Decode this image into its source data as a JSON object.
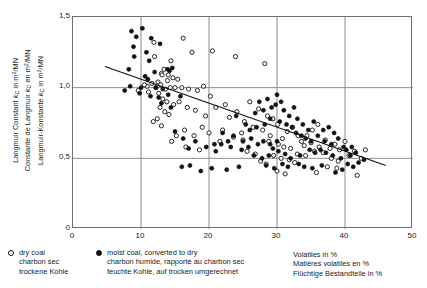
{
  "chart_data": {
    "type": "scatter",
    "title": "",
    "xlabel": "Volatiles in %",
    "ylabel": "Langmuir Constant kC in m2/MN",
    "xlim": [
      0,
      50
    ],
    "ylim": [
      0,
      1.5
    ],
    "grid": true,
    "y_ticks": [
      "1,5",
      "1,0",
      "0,5",
      "0"
    ],
    "y_tick_values": [
      1.5,
      1.0,
      0.5,
      0
    ],
    "x_ticks": [
      "0",
      "10",
      "20",
      "30",
      "40",
      "50"
    ],
    "x_tick_values": [
      0,
      10,
      20,
      30,
      40,
      50
    ],
    "legend_position": "below-left",
    "series": [
      {
        "name": "dry coal",
        "marker": "open-circle",
        "points": [
          [
            11.9,
            1.32
          ],
          [
            12.0,
            1.22
          ],
          [
            14.4,
            1.19
          ],
          [
            16.2,
            1.35
          ],
          [
            17.5,
            1.25
          ],
          [
            20.5,
            1.26
          ],
          [
            23.9,
            1.22
          ],
          [
            28.2,
            1.17
          ],
          [
            13.0,
            1.1
          ],
          [
            13.1,
            1.09
          ],
          [
            13.4,
            1.13
          ],
          [
            14.0,
            1.09
          ],
          [
            13.9,
            1.05
          ],
          [
            14.7,
            1.07
          ],
          [
            15.4,
            1.06
          ],
          [
            12.5,
            1.04
          ],
          [
            11.6,
            1.03
          ],
          [
            10.9,
            1.01
          ],
          [
            10.5,
            1.02
          ],
          [
            12.2,
            1.0
          ],
          [
            12.9,
            1.02
          ],
          [
            13.6,
            0.99
          ],
          [
            14.3,
            1.0
          ],
          [
            15.0,
            1.0
          ],
          [
            9.6,
            0.98
          ],
          [
            11.1,
            0.97
          ],
          [
            12.6,
            0.96
          ],
          [
            16.0,
            1.0
          ],
          [
            17.0,
            0.99
          ],
          [
            18.3,
            0.98
          ],
          [
            19.2,
            1.01
          ],
          [
            20.2,
            0.94
          ],
          [
            13.2,
            0.92
          ],
          [
            13.8,
            0.9
          ],
          [
            14.8,
            0.88
          ],
          [
            15.6,
            0.9
          ],
          [
            12.8,
            0.86
          ],
          [
            13.5,
            0.83
          ],
          [
            14.1,
            0.81
          ],
          [
            12.4,
            0.78
          ],
          [
            11.8,
            0.76
          ],
          [
            13.0,
            0.73
          ],
          [
            16.8,
            0.86
          ],
          [
            18.0,
            0.84
          ],
          [
            19.5,
            0.8
          ],
          [
            21.0,
            0.86
          ],
          [
            22.4,
            0.88
          ],
          [
            23.0,
            0.79
          ],
          [
            24.1,
            0.83
          ],
          [
            25.2,
            0.76
          ],
          [
            22.0,
            0.7
          ],
          [
            24.8,
            0.68
          ],
          [
            26.0,
            0.9
          ],
          [
            27.3,
            0.85
          ],
          [
            28.6,
            0.8
          ],
          [
            29.4,
            0.78
          ],
          [
            30.1,
            0.74
          ],
          [
            26.5,
            0.72
          ],
          [
            27.9,
            0.7
          ],
          [
            29.0,
            0.66
          ],
          [
            30.8,
            0.64
          ],
          [
            31.5,
            0.69
          ],
          [
            32.3,
            0.72
          ],
          [
            33.1,
            0.66
          ],
          [
            28.8,
            0.62
          ],
          [
            30.2,
            0.6
          ],
          [
            31.0,
            0.58
          ],
          [
            32.0,
            0.57
          ],
          [
            33.6,
            0.62
          ],
          [
            34.4,
            0.66
          ],
          [
            35.2,
            0.7
          ],
          [
            36.0,
            0.74
          ],
          [
            34.0,
            0.59
          ],
          [
            35.0,
            0.61
          ],
          [
            36.2,
            0.58
          ],
          [
            37.1,
            0.63
          ],
          [
            33.0,
            0.53
          ],
          [
            34.2,
            0.52
          ],
          [
            35.5,
            0.55
          ],
          [
            36.8,
            0.54
          ],
          [
            29.5,
            0.52
          ],
          [
            30.6,
            0.5
          ],
          [
            31.8,
            0.49
          ],
          [
            32.6,
            0.47
          ],
          [
            27.6,
            0.48
          ],
          [
            28.4,
            0.46
          ],
          [
            26.8,
            0.53
          ],
          [
            25.6,
            0.55
          ],
          [
            37.8,
            0.57
          ],
          [
            38.5,
            0.6
          ],
          [
            39.2,
            0.56
          ],
          [
            40.0,
            0.62
          ],
          [
            38.0,
            0.5
          ],
          [
            39.0,
            0.48
          ],
          [
            40.6,
            0.52
          ],
          [
            41.4,
            0.55
          ],
          [
            37.4,
            0.44
          ],
          [
            38.8,
            0.43
          ],
          [
            30.0,
            0.41
          ],
          [
            31.2,
            0.39
          ],
          [
            35.8,
            0.4
          ],
          [
            41.8,
            0.38
          ],
          [
            42.4,
            0.5
          ],
          [
            43.0,
            0.56
          ],
          [
            25.0,
            0.63
          ],
          [
            23.6,
            0.65
          ],
          [
            21.6,
            0.62
          ],
          [
            20.0,
            0.68
          ],
          [
            19.0,
            0.72
          ],
          [
            17.8,
            0.66
          ],
          [
            16.4,
            0.7
          ],
          [
            15.2,
            0.66
          ],
          [
            14.5,
            0.62
          ],
          [
            16.6,
            0.58
          ],
          [
            18.6,
            0.56
          ]
        ]
      },
      {
        "name": "moist coal, converted to dry",
        "marker": "filled-circle",
        "points": [
          [
            8.6,
            1.4
          ],
          [
            10.2,
            1.42
          ],
          [
            9.3,
            1.36
          ],
          [
            11.5,
            1.35
          ],
          [
            8.9,
            1.29
          ],
          [
            12.8,
            1.31
          ],
          [
            10.8,
            1.25
          ],
          [
            9.0,
            1.22
          ],
          [
            11.2,
            1.19
          ],
          [
            8.2,
            1.13
          ],
          [
            12.0,
            1.11
          ],
          [
            13.9,
            1.13
          ],
          [
            14.2,
            1.12
          ],
          [
            14.6,
            1.14
          ],
          [
            10.6,
            1.08
          ],
          [
            11.0,
            1.06
          ],
          [
            8.4,
            1.01
          ],
          [
            10.0,
            1.0
          ],
          [
            12.2,
            1.0
          ],
          [
            13.2,
            0.99
          ],
          [
            7.6,
            0.98
          ],
          [
            9.8,
            0.96
          ],
          [
            11.4,
            0.94
          ],
          [
            12.6,
            0.93
          ],
          [
            14.0,
            0.95
          ],
          [
            15.8,
            0.94
          ],
          [
            13.0,
            0.89
          ],
          [
            14.4,
            0.86
          ],
          [
            15.0,
            0.69
          ],
          [
            16.2,
            0.64
          ],
          [
            22.0,
            0.68
          ],
          [
            23.6,
            0.66
          ],
          [
            25.0,
            0.62
          ],
          [
            26.2,
            0.64
          ],
          [
            17.0,
            0.57
          ],
          [
            21.0,
            0.55
          ],
          [
            24.0,
            0.8
          ],
          [
            26.8,
            0.82
          ],
          [
            28.0,
            0.84
          ],
          [
            29.2,
            0.86
          ],
          [
            27.4,
            0.9
          ],
          [
            28.6,
            0.92
          ],
          [
            29.8,
            0.88
          ],
          [
            30.6,
            0.9
          ],
          [
            30.0,
            0.95
          ],
          [
            31.0,
            0.84
          ],
          [
            31.8,
            0.8
          ],
          [
            32.5,
            0.86
          ],
          [
            29.0,
            0.78
          ],
          [
            30.4,
            0.76
          ],
          [
            31.4,
            0.74
          ],
          [
            32.2,
            0.72
          ],
          [
            28.2,
            0.74
          ],
          [
            27.0,
            0.72
          ],
          [
            26.0,
            0.7
          ],
          [
            25.4,
            0.74
          ],
          [
            33.0,
            0.78
          ],
          [
            33.8,
            0.74
          ],
          [
            34.6,
            0.7
          ],
          [
            35.4,
            0.76
          ],
          [
            32.8,
            0.68
          ],
          [
            33.6,
            0.66
          ],
          [
            34.2,
            0.64
          ],
          [
            35.0,
            0.62
          ],
          [
            36.0,
            0.66
          ],
          [
            36.8,
            0.7
          ],
          [
            37.6,
            0.72
          ],
          [
            38.4,
            0.68
          ],
          [
            37.0,
            0.62
          ],
          [
            38.0,
            0.6
          ],
          [
            39.0,
            0.64
          ],
          [
            39.8,
            0.58
          ],
          [
            36.4,
            0.56
          ],
          [
            37.2,
            0.54
          ],
          [
            38.2,
            0.52
          ],
          [
            39.4,
            0.5
          ],
          [
            40.2,
            0.56
          ],
          [
            41.0,
            0.58
          ],
          [
            40.8,
            0.52
          ],
          [
            41.6,
            0.54
          ],
          [
            34.8,
            0.56
          ],
          [
            35.6,
            0.54
          ],
          [
            33.4,
            0.52
          ],
          [
            32.0,
            0.5
          ],
          [
            31.2,
            0.53
          ],
          [
            30.2,
            0.55
          ],
          [
            29.4,
            0.57
          ],
          [
            28.8,
            0.52
          ],
          [
            27.8,
            0.5
          ],
          [
            26.6,
            0.52
          ],
          [
            30.8,
            0.46
          ],
          [
            31.6,
            0.44
          ],
          [
            29.6,
            0.43
          ],
          [
            28.4,
            0.45
          ],
          [
            33.2,
            0.46
          ],
          [
            34.0,
            0.44
          ],
          [
            35.2,
            0.43
          ],
          [
            36.6,
            0.45
          ],
          [
            24.4,
            0.44
          ],
          [
            22.6,
            0.42
          ],
          [
            20.4,
            0.43
          ],
          [
            18.8,
            0.41
          ],
          [
            17.2,
            0.45
          ],
          [
            16.0,
            0.44
          ],
          [
            40.4,
            0.46
          ],
          [
            41.2,
            0.44
          ],
          [
            42.0,
            0.47
          ],
          [
            42.8,
            0.49
          ],
          [
            19.6,
            0.58
          ],
          [
            20.8,
            0.6
          ],
          [
            18.0,
            0.62
          ],
          [
            23.2,
            0.58
          ],
          [
            24.8,
            0.56
          ],
          [
            25.8,
            0.58
          ],
          [
            21.8,
            0.6
          ],
          [
            22.8,
            0.62
          ],
          [
            27.2,
            0.6
          ],
          [
            28.0,
            0.62
          ],
          [
            29.0,
            0.6
          ],
          [
            30.0,
            0.62
          ],
          [
            39.6,
            0.42
          ],
          [
            38.6,
            0.4
          ]
        ]
      }
    ],
    "fit_line": {
      "label": "regression line",
      "x_start": 4.7,
      "y_start": 1.15,
      "x_end": 46.0,
      "y_end": 0.45
    }
  },
  "axis_titles": {
    "y_lines": [
      "Langmuir Constant kC in m2/MN",
      "Constante de Langmuir kC en m2/MN",
      "Langmuir-Konstante kC in m2/MN"
    ],
    "x_lines": [
      "Volatiles in %",
      "Matières volatiles en %",
      "Flüchtige Bestandteile in %"
    ]
  },
  "legend": {
    "entries": [
      {
        "marker": "open-circle",
        "lines": [
          "dry coal",
          "charbon sec",
          "trockene Kohle"
        ]
      },
      {
        "marker": "filled-circle",
        "lines": [
          "moist coal, converted to dry",
          "charbon humide, rapporté au charbon sec",
          "feuchte Kohle, auf trocken umgerechnet"
        ]
      }
    ]
  },
  "colors": {
    "frame": "#6f6f6f",
    "grid": "#8d8d8d",
    "marker": "#111111",
    "background": "#ffffff"
  }
}
